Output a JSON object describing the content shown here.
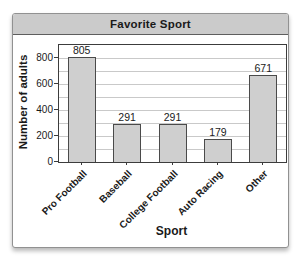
{
  "widget": {
    "title": "Favorite Sport"
  },
  "chart_data": {
    "type": "bar",
    "title": "Favorite Sport",
    "categories": [
      "Pro Football",
      "Baseball",
      "College Football",
      "Auto Racing",
      "Other"
    ],
    "values": [
      805,
      291,
      291,
      179,
      671
    ],
    "value_labels": [
      "805",
      "291",
      "291",
      "179",
      "671"
    ],
    "xlabel": "Sport",
    "ylabel": "Number of adults",
    "ylim": [
      0,
      900
    ],
    "yticks": [
      0,
      200,
      400,
      600,
      800
    ],
    "gridline_interval": 100,
    "grid": true,
    "legend_position": "none",
    "colors": {
      "bar_fill": "#cfcfcf",
      "bar_border": "#4a4a4a",
      "gridline": "#c9c9c9",
      "plot_border": "#3c3c3c",
      "titlebar_fill": "#cbcbcb",
      "titlebar_border": "#5e5e5e",
      "card_border": "#919191",
      "text": "#1a1a1a"
    }
  }
}
